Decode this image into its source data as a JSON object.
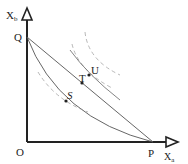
{
  "diagram": {
    "type": "phase-diagram",
    "axes": {
      "y_label": "X",
      "y_label_sub": "b",
      "x_label": "X",
      "x_label_sub": "a",
      "origin_label": "O"
    },
    "points": {
      "Q": "Q",
      "P": "P",
      "S": "S",
      "T": "T",
      "U": "U"
    },
    "colors": {
      "axis": "#222222",
      "line": "#555555",
      "dashed": "#888888",
      "text": "#222222"
    }
  }
}
